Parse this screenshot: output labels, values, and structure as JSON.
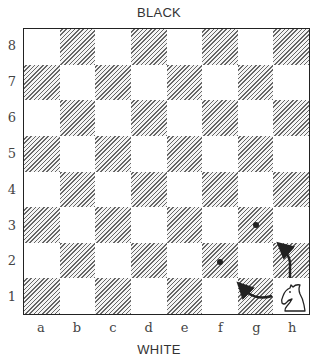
{
  "labels": {
    "top": "BLACK",
    "bottom": "WHITE"
  },
  "board": {
    "ranks": [
      "8",
      "7",
      "6",
      "5",
      "4",
      "3",
      "2",
      "1"
    ],
    "files": [
      "a",
      "b",
      "c",
      "d",
      "e",
      "f",
      "g",
      "h"
    ],
    "dark_square_style": "hatched",
    "pieces": [
      {
        "square": "h1",
        "piece": "knight",
        "color": "white"
      }
    ],
    "target_markers": [
      {
        "square": "f2",
        "type": "dot"
      },
      {
        "square": "g3",
        "type": "dot"
      }
    ],
    "move_arrows": [
      {
        "from": "h1",
        "to": "g2",
        "path": "h1→g1 curve toward g2",
        "description": "knight move to f2 via g1"
      },
      {
        "from": "h1",
        "to": "h3",
        "path": "h2 up to h3 then toward g3",
        "description": "knight move to g3 via h2"
      }
    ]
  },
  "colors": {
    "line": "#222222",
    "hatch": "#666666",
    "text": "#333333"
  }
}
